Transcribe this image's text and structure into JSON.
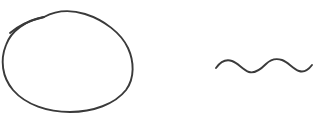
{
  "canvas": {
    "width": 316,
    "height": 125,
    "background_color": "#ffffff",
    "description": "Hand-drawn pen sketch on plain white background: a closed oval on the left and a short wavy line on the right"
  },
  "ink": {
    "stroke_color": "#3a3a3a",
    "stroke_width": 1.9,
    "style": "hand-drawn pen stroke"
  },
  "shapes": [
    {
      "name": "oval",
      "kind": "ellipse",
      "center_x": 68,
      "center_y": 61,
      "radius_x": 64,
      "radius_y": 51,
      "bounds": {
        "left": 4,
        "top": 10,
        "right": 132,
        "bottom": 112
      },
      "path": "M 44 17 C 26 20 11 31 6 45 C 0 60 2 77 13 90 C 26 105 48 112 70 112 C 93 112 115 104 126 90 C 135 78 134 61 128 48 C 121 33 104 20 85 14 C 72 10 57 10 44 17"
    },
    {
      "name": "oval-overshoot-tail",
      "kind": "arc",
      "description": "inner starting stroke at the upper-left that overshoots the oval outline",
      "start_x": 10,
      "start_y": 33,
      "end_x": 44,
      "end_y": 17,
      "path": "M 10 33 C 17 27 27 21 44 17"
    },
    {
      "name": "wavy-line",
      "kind": "sine-wave",
      "description": "two-cycle horizontal squiggle",
      "start_x": 216,
      "end_x": 312,
      "baseline_y": 66,
      "amplitude": 6,
      "period": 40,
      "cycles": 2,
      "path": "M 216 68 C 221 61 226 59 232 61 C 238 63 243 70 249 72 C 255 74 261 69 266 64 C 271 59 276 58 282 60 C 288 62 293 69 299 71 C 305 73 309 69 312 65"
    }
  ]
}
